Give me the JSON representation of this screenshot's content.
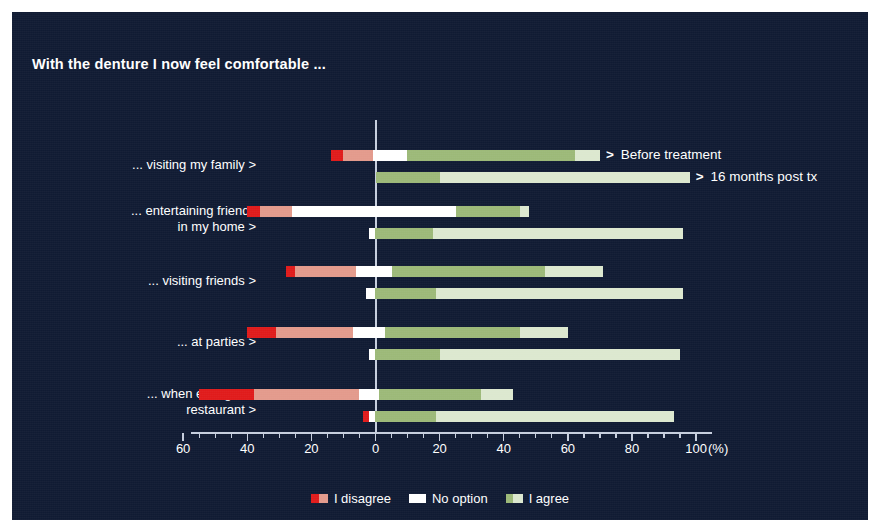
{
  "figure": {
    "title": "With the denture I now feel comfortable ...",
    "panel_color": "#101b33",
    "axis_color": "#c6cede"
  },
  "axis": {
    "unit_label": "(%)",
    "tick_labels": [
      "60",
      "40",
      "20",
      "0",
      "20",
      "40",
      "60",
      "80",
      "100"
    ],
    "tick_values": [
      -60,
      -40,
      -20,
      0,
      20,
      40,
      60,
      80,
      100
    ]
  },
  "series_callouts": [
    {
      "marker": ">",
      "label": "Before treatment"
    },
    {
      "marker": ">",
      "label": "16 months post tx"
    }
  ],
  "legend": {
    "items": [
      {
        "label": "I disagree",
        "colors": [
          "#e01b1b",
          "#e39a8c"
        ]
      },
      {
        "label": "No option",
        "colors": [
          "#ffffff"
        ]
      },
      {
        "label": "I agree",
        "colors": [
          "#9cb978",
          "#dce8cf"
        ]
      }
    ]
  },
  "chart_data": {
    "type": "bar",
    "subtype": "diverging-stacked-bar",
    "title": "With the denture I now feel comfortable ...",
    "xlabel": "(%)",
    "ylabel": "",
    "xlim": [
      -60,
      100
    ],
    "xticks": [
      -60,
      -40,
      -20,
      0,
      20,
      40,
      60,
      80,
      100
    ],
    "xticklabels": [
      "60",
      "40",
      "20",
      "0",
      "20",
      "40",
      "60",
      "80",
      "100"
    ],
    "grid": false,
    "legend_position": "bottom-center",
    "segments": [
      {
        "name": "I disagree (strongly)",
        "color": "#e01b1b"
      },
      {
        "name": "I disagree",
        "color": "#e39a8c"
      },
      {
        "name": "No option",
        "color": "#ffffff"
      },
      {
        "name": "I agree",
        "color": "#9cb978"
      },
      {
        "name": "I agree (strongly)",
        "color": "#dce8cf"
      }
    ],
    "series": [
      {
        "name": "Before treatment"
      },
      {
        "name": "16 months post tx"
      }
    ],
    "categories": [
      "... visiting my family >",
      "... entertaining friends in my home >",
      "... visiting friends >",
      "... at parties >",
      "... when eating in a restaurant >"
    ],
    "groups": [
      {
        "category": "... visiting my family >",
        "label_lines": [
          "... visiting my family >"
        ],
        "bars": [
          {
            "series": "Before treatment",
            "disagree_strong": 4,
            "disagree": 10,
            "no_option": 11,
            "agree": 55,
            "agree_strong": 8,
            "start": -14,
            "end": 70
          },
          {
            "series": "16 months post tx",
            "disagree_strong": 0,
            "disagree": 0,
            "no_option": 0,
            "agree": 20,
            "agree_strong": 78,
            "start": 0,
            "end": 98
          }
        ]
      },
      {
        "category": "... entertaining friends in my home >",
        "label_lines": [
          "... entertaining friends",
          "in my home >"
        ],
        "bars": [
          {
            "series": "Before treatment",
            "disagree_strong": 4,
            "disagree": 10,
            "no_option": 52,
            "agree": 20,
            "agree_strong": 3,
            "start": -40,
            "end": 48
          },
          {
            "series": "16 months post tx",
            "disagree_strong": 0,
            "disagree": 0,
            "no_option": 2,
            "agree": 18,
            "agree_strong": 78,
            "start": -2,
            "end": 97
          }
        ]
      },
      {
        "category": "... visiting friends >",
        "label_lines": [
          "... visiting friends >"
        ],
        "bars": [
          {
            "series": "Before treatment",
            "disagree_strong": 3,
            "disagree": 19,
            "no_option": 11,
            "agree": 48,
            "agree_strong": 18,
            "start": -28,
            "end": 71
          },
          {
            "series": "16 months post tx",
            "disagree_strong": 0,
            "disagree": 0,
            "no_option": 3,
            "agree": 19,
            "agree_strong": 77,
            "start": -3,
            "end": 96
          }
        ]
      },
      {
        "category": "... at parties >",
        "label_lines": [
          "... at parties >"
        ],
        "bars": [
          {
            "series": "Before treatment",
            "disagree_strong": 9,
            "disagree": 24,
            "no_option": 10,
            "agree": 42,
            "agree_strong": 15,
            "start": -40,
            "end": 60
          },
          {
            "series": "16 months post tx",
            "disagree_strong": 0,
            "disagree": 0,
            "no_option": 2,
            "agree": 20,
            "agree_strong": 75,
            "start": -2,
            "end": 95
          }
        ]
      },
      {
        "category": "... when eating in a restaurant >",
        "label_lines": [
          "... when eating in a",
          "restaurant >"
        ],
        "bars": [
          {
            "series": "Before treatment",
            "disagree_strong": 17,
            "disagree": 33,
            "no_option": 6,
            "agree": 32,
            "agree_strong": 10,
            "start": -55,
            "end": 43
          },
          {
            "series": "16 months post tx",
            "disagree_strong": 2,
            "disagree": 0,
            "no_option": 2,
            "agree": 19,
            "agree_strong": 74,
            "start": -4,
            "end": 93
          }
        ]
      }
    ]
  }
}
